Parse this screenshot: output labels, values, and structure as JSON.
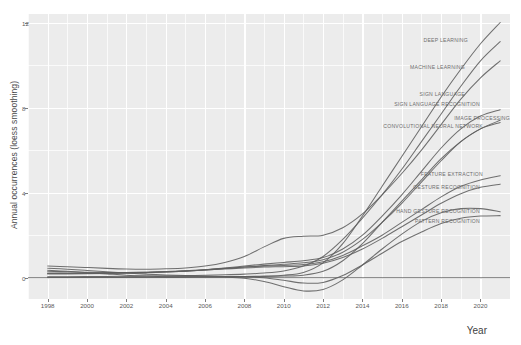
{
  "chart_data": {
    "type": "line",
    "title": "",
    "xlabel": "Year",
    "ylabel": "Annual occurrences (loess smoothing)",
    "xlim": [
      1997,
      2021.5
    ],
    "ylim": [
      -1.0,
      12.4
    ],
    "xticks": [
      1998,
      2000,
      2002,
      2004,
      2006,
      2008,
      2010,
      2012,
      2014,
      2016,
      2018,
      2020
    ],
    "yticks": [
      0,
      4,
      8,
      12
    ],
    "grid": true,
    "legend_position": "inline-end-labels",
    "x": [
      1998,
      1999,
      2000,
      2001,
      2002,
      2003,
      2004,
      2005,
      2006,
      2007,
      2008,
      2009,
      2010,
      2011,
      2012,
      2013,
      2014,
      2015,
      2016,
      2017,
      2018,
      2019,
      2020,
      2021
    ],
    "series": [
      {
        "name": "DEEP LEARNING",
        "label": "DEEP LEARNING",
        "values": [
          0.02,
          0.02,
          0.02,
          0.03,
          0.03,
          0.03,
          0.04,
          0.04,
          0.05,
          0.05,
          0.06,
          0.08,
          0.12,
          0.25,
          0.7,
          1.6,
          2.9,
          4.3,
          5.7,
          7.1,
          8.5,
          9.8,
          11.0,
          12.0
        ]
      },
      {
        "name": "MACHINE LEARNING",
        "label": "MACHINE LEARNING",
        "values": [
          0.05,
          0.05,
          0.06,
          0.06,
          0.07,
          0.08,
          0.09,
          0.1,
          0.12,
          0.14,
          0.17,
          0.22,
          0.32,
          0.55,
          1.0,
          1.8,
          2.8,
          3.9,
          5.1,
          6.4,
          7.7,
          9.0,
          10.2,
          11.1
        ]
      },
      {
        "name": "SIGN LANGUAGE",
        "label": "SIGN LANGUAGE",
        "values": [
          0.55,
          0.52,
          0.48,
          0.44,
          0.41,
          0.4,
          0.42,
          0.46,
          0.55,
          0.72,
          1.0,
          1.45,
          1.85,
          1.95,
          2.0,
          2.35,
          3.0,
          3.9,
          4.9,
          6.0,
          7.2,
          8.4,
          9.4,
          10.2
        ]
      },
      {
        "name": "SIGN LANGUAGE RECOGNITION",
        "label": "SIGN LANGUAGE RECOGNITION",
        "values": [
          0.3,
          0.28,
          0.26,
          0.25,
          0.25,
          0.26,
          0.28,
          0.32,
          0.38,
          0.46,
          0.55,
          0.64,
          0.72,
          0.8,
          0.95,
          1.35,
          2.0,
          2.9,
          3.9,
          5.0,
          6.1,
          7.0,
          7.6,
          7.9
        ]
      },
      {
        "name": "IMAGE PROCESSING",
        "label": "IMAGE PROCESSING",
        "values": [
          0.2,
          0.2,
          0.2,
          0.21,
          0.22,
          0.24,
          0.27,
          0.31,
          0.36,
          0.43,
          0.5,
          0.57,
          0.63,
          0.7,
          0.85,
          1.2,
          1.8,
          2.6,
          3.5,
          4.5,
          5.5,
          6.4,
          7.0,
          7.4
        ]
      },
      {
        "name": "CONVOLUTIONAL NEURAL NETWORK",
        "label": "CONVOLUTIONAL NEURAL NETWORK",
        "values": [
          0.01,
          0.01,
          0.01,
          0.01,
          0.02,
          0.02,
          0.02,
          0.03,
          0.03,
          0.04,
          0.05,
          0.06,
          0.08,
          0.12,
          0.3,
          0.8,
          1.6,
          2.6,
          3.6,
          4.6,
          5.6,
          6.4,
          7.0,
          7.3
        ]
      },
      {
        "name": "FEATURE EXTRACTION",
        "label": "FEATURE EXTRACTION",
        "values": [
          0.22,
          0.22,
          0.22,
          0.23,
          0.24,
          0.26,
          0.29,
          0.33,
          0.38,
          0.44,
          0.5,
          0.55,
          0.58,
          0.62,
          0.75,
          1.05,
          1.5,
          2.0,
          2.6,
          3.2,
          3.8,
          4.3,
          4.6,
          4.8
        ]
      },
      {
        "name": "GESTURE RECOGNITION",
        "label": "GESTURE RECOGNITION",
        "values": [
          0.18,
          0.18,
          0.19,
          0.2,
          0.22,
          0.24,
          0.27,
          0.31,
          0.36,
          0.41,
          0.46,
          0.5,
          0.52,
          0.55,
          0.68,
          0.95,
          1.35,
          1.85,
          2.4,
          2.95,
          3.5,
          3.95,
          4.25,
          4.4
        ]
      },
      {
        "name": "HAND GESTURE RECOGNITION",
        "label": "HAND GESTURE RECOGNITION",
        "values": [
          0.35,
          0.3,
          0.24,
          0.18,
          0.12,
          0.08,
          0.05,
          0.04,
          0.04,
          0.03,
          -0.02,
          -0.18,
          -0.42,
          -0.62,
          -0.55,
          -0.1,
          0.6,
          1.35,
          2.05,
          2.65,
          3.05,
          3.25,
          3.25,
          3.1
        ]
      },
      {
        "name": "PATTERN RECOGNITION",
        "label": "PATTERN RECOGNITION",
        "values": [
          0.45,
          0.4,
          0.34,
          0.28,
          0.22,
          0.17,
          0.13,
          0.1,
          0.08,
          0.06,
          0.04,
          0.0,
          -0.12,
          -0.25,
          -0.22,
          0.1,
          0.6,
          1.15,
          1.7,
          2.15,
          2.55,
          2.8,
          2.9,
          2.92
        ]
      }
    ]
  },
  "axis": {
    "y_title": "Annual occurrences (loess smoothing)",
    "x_title": "Year"
  },
  "colors": {
    "panel_background": "#ececec",
    "gridline": "#ffffff",
    "line": "#5d5d5d",
    "label_text": "#6e6e6e",
    "tick_text": "#5a5a5a",
    "zero_rule": "#3a3a3a"
  }
}
